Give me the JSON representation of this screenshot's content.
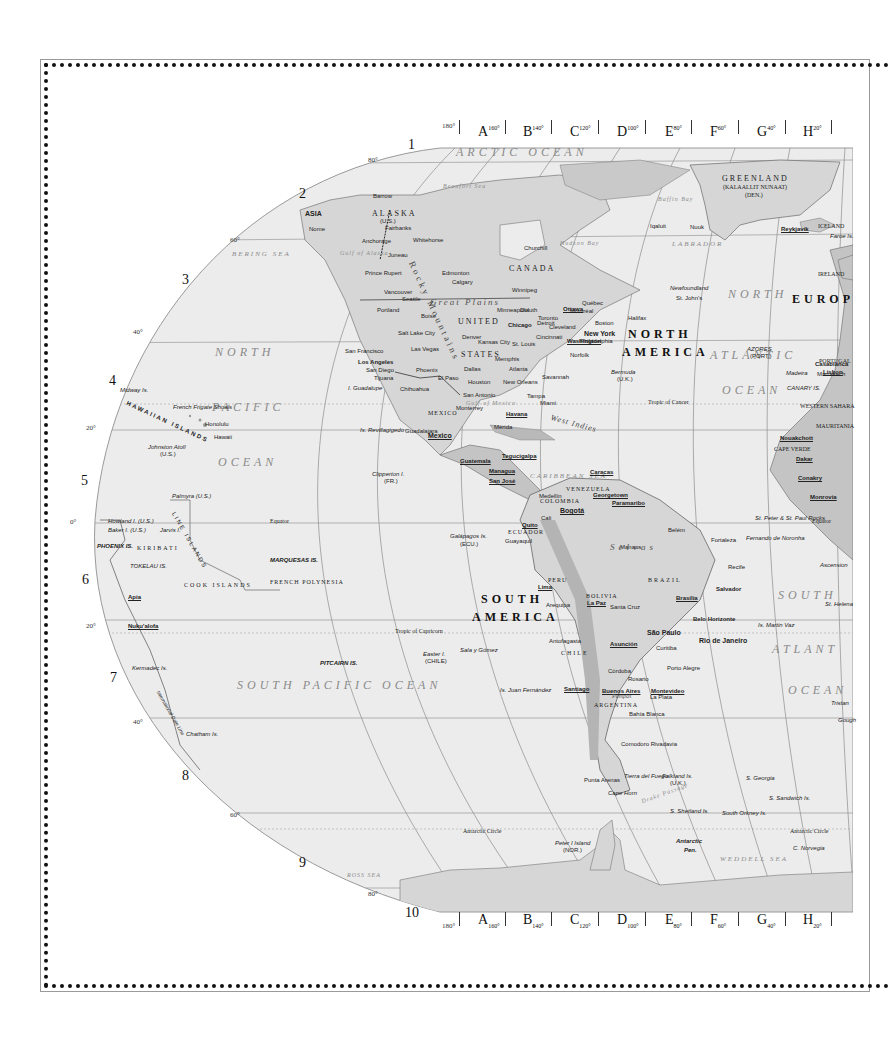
{
  "map": {
    "title": "World Map - Western Hemisphere (partial)",
    "top_columns": [
      {
        "letter": "A",
        "deg": "160°"
      },
      {
        "letter": "B",
        "deg": "140°"
      },
      {
        "letter": "C",
        "deg": "120°"
      },
      {
        "letter": "D",
        "deg": "100°"
      },
      {
        "letter": "E",
        "deg": "80°"
      },
      {
        "letter": "F",
        "deg": "60°"
      },
      {
        "letter": "G",
        "deg": "40°"
      },
      {
        "letter": "H",
        "deg": "20°"
      }
    ],
    "start_deg": "180°",
    "rows": [
      "1",
      "2",
      "3",
      "4",
      "5",
      "6",
      "7",
      "8",
      "9",
      "10"
    ],
    "lat_labels": {
      "n80": "80°",
      "n60": "60°",
      "n40": "40°",
      "n20": "20°",
      "eq": "0°",
      "s20": "20°",
      "s40": "40°",
      "s60": "60°",
      "s80": "80°"
    },
    "oceans": {
      "arctic": "ARCTIC OCEAN",
      "north_pacific_1": "NORTH",
      "north_pacific_2": "PACIFIC",
      "north_pacific_3": "OCEAN",
      "south_pacific": "SOUTH PACIFIC OCEAN",
      "north_atlantic_1": "NORTH",
      "north_atlantic_2": "ATLANTIC",
      "north_atlantic_3": "OCEAN",
      "south_atlantic_1": "SOUTH",
      "south_atlantic_2": "ATLANT",
      "south_atlantic_3": "OCEAN",
      "bering": "BERING SEA",
      "caribbean": "CARIBBEAN SEA",
      "weddell": "WEDDELL SEA",
      "ross": "ROSS SEA",
      "labrador": "LABRADOR",
      "beaufort": "Beaufort Sea",
      "hudson": "Hudson Bay",
      "baffin": "Baffin Bay",
      "gulf_mexico": "Gulf of Mexico",
      "gulf_alaska": "Gulf of Alaska",
      "drake": "Drake Passage"
    },
    "continents": {
      "north_america_1": "NORTH",
      "north_america_2": "AMERICA",
      "south_america_1": "SOUTH",
      "south_america_2": "AMERICA",
      "europe": "EUROP",
      "asia": "ASIA"
    },
    "countries": {
      "greenland": "GREENLAND",
      "greenland_sub": "(KALAALLIT NUNAAT)",
      "greenland_den": "(DEN.)",
      "canada": "CANADA",
      "alaska": "ALASKA",
      "alaska_us": "(U.S.)",
      "united": "UNITED",
      "states": "STATES",
      "mexico": "MEXICO",
      "brazil": "BRAZIL",
      "peru": "PERU",
      "bolivia": "BOLIVIA",
      "chile": "CHILE",
      "argentina": "ARGENTINA",
      "colombia": "COLOMBIA",
      "venezuela": "VENEZUELA",
      "ecuador": "ECUADOR",
      "kiribati": "KIRIBATI",
      "cook_islands": "COOK ISLANDS",
      "french_polynesia": "FRENCH POLYNESIA",
      "hawaiian_islands": "HAWAIIAN ISLANDS",
      "line_islands": "LINE ISLANDS",
      "portugal": "PORTUGAL",
      "ireland": "IRELAND",
      "mauritania": "MAURITANIA",
      "western_sahara": "WESTERN SAHARA",
      "iceland": "ICELAND"
    },
    "lines": {
      "equator_left": "Equator",
      "equator_right": "Equator",
      "tropic_cancer": "Tropic of Cancer",
      "tropic_capricorn": "Tropic of Capricorn",
      "antarctic_circle_left": "Antarctic Circle",
      "antarctic_circle_right": "Antarctic Circle",
      "idl": "International Date Line"
    },
    "capitals": {
      "mexico": "Mexico",
      "washington": "Washington",
      "ottawa": "Ottawa",
      "havana": "Havana",
      "bogota": "Bogotá",
      "caracas": "Caracas",
      "lima": "Lima",
      "la_paz": "La Paz",
      "brasilia": "Brasília",
      "santiago": "Santiago",
      "buenos_aires": "Buenos Aires",
      "montevideo": "Montevideo",
      "asuncion": "Asunción",
      "quito": "Quito",
      "reykjavik": "Reykjavík",
      "lisbon": "Lisbon",
      "dakar": "Dakar",
      "nouakchott": "Nouakchott",
      "guatemala": "Guatemala",
      "tegucigalpa": "Tegucigalpa",
      "managua": "Managua",
      "san_jose": "San José",
      "georgetown": "Georgetown",
      "paramaribo": "Paramaribo",
      "apia": "Apia",
      "nukualofa": "Nuku'alofa",
      "conakry": "Conakry",
      "monrovia": "Monrovia"
    },
    "cities": {
      "new_york": "New York",
      "los_angeles": "Los Angeles",
      "chicago": "Chicago",
      "san_francisco": "San Francisco",
      "san_diego": "San Diego",
      "tijuana": "Tijuana",
      "seattle": "Seattle",
      "vancouver": "Vancouver",
      "portland": "Portland",
      "denver": "Denver",
      "dallas": "Dallas",
      "houston": "Houston",
      "phoenix": "Phoenix",
      "el_paso": "El Paso",
      "las_vegas": "Las Vegas",
      "salt_lake": "Salt Lake City",
      "boise": "Boise",
      "miami": "Miami",
      "atlanta": "Atlanta",
      "montreal": "Montréal",
      "toronto": "Toronto",
      "boston": "Boston",
      "winnipeg": "Winnipeg",
      "edmonton": "Edmonton",
      "calgary": "Calgary",
      "anchorage": "Anchorage",
      "fairbanks": "Fairbanks",
      "honolulu": "Honolulu",
      "hawaii": "Hawaii",
      "sao_paulo": "São Paulo",
      "rio": "Rio de Janeiro",
      "salvador": "Salvador",
      "recife": "Recife",
      "fortaleza": "Fortaleza",
      "belem": "Belém",
      "manaus": "Manaus",
      "belo_horizonte": "Belo Horizonte",
      "porto_alegre": "Porto Alegre",
      "curitiba": "Curitiba",
      "cordoba": "Córdoba",
      "rosario": "Rosario",
      "la_plata": "La Plata",
      "bahia_blanca": "Bahía Blanca",
      "comodoro": "Comodoro Rivadavia",
      "punta_arenas": "Punta Arenas",
      "cape_horn": "Cape Horn",
      "guayaquil": "Guayaquil",
      "medellin": "Medellín",
      "cali": "Cali",
      "arequipa": "Arequipa",
      "antofagasta": "Antofagasta",
      "santa_cruz": "Santa Cruz",
      "casablanca": "Casablanca",
      "marrakech": "Marrakech",
      "nuuk": "Nuuk",
      "nome": "Nome",
      "barrow": "Barrow",
      "whitehorse": "Whitehorse",
      "juneau": "Juneau",
      "prince_rupert": "Prince Rupert",
      "churchill": "Churchill",
      "iqaluit": "Iqaluit",
      "halifax": "Halifax",
      "st_johns": "St. John's",
      "newfoundland": "Newfoundland",
      "chihuahua": "Chihuahua",
      "monterrey": "Monterrey",
      "merida": "Mérida",
      "guadalajara": "Guadalajara",
      "acapulco": "Acapulco",
      "san_antonio": "San Antonio",
      "new_orleans": "New Orleans",
      "memphis": "Memphis",
      "kansas_city": "Kansas City",
      "st_louis": "St. Louis",
      "cincinnati": "Cincinnati",
      "detroit": "Detroit",
      "cleveland": "Cleveland",
      "minneapolis": "Minneapolis",
      "duluth": "Duluth",
      "philadelphia": "Philadelphia",
      "norfolk": "Norfolk",
      "savannah": "Savannah",
      "tampa": "Tampa",
      "quebec": "Québec"
    },
    "islands": {
      "midway": "Midway Is.",
      "french_frigate": "French Frigate Shoals",
      "johnston": "Johnston Atoll",
      "johnston_us": "(U.S.)",
      "palmyra": "Palmyra (U.S.)",
      "howland": "Howland I. (U.S.)",
      "baker": "Baker I. (U.S.)",
      "jarvis": "Jarvis I.",
      "phoenix": "PHOENIX IS.",
      "tokelau": "TOKELAU IS.",
      "marquesas": "MARQUESAS IS.",
      "pitcairn": "PITCAIRN IS.",
      "kermadec": "Kermadec Is.",
      "chatham": "Chatham Is.",
      "galapagos": "Galápagos Is.",
      "galapagos_ecu": "(ECU.)",
      "clipperton": "Clipperton I.",
      "clipperton_fr": "(FR.)",
      "revillagigedo": "Is. Revillagigedo",
      "guadalupe": "I. Guadalupe",
      "bermuda": "Bermuda",
      "bermuda_uk": "(U.K.)",
      "azores": "AZORES",
      "azores_port": "(PORT.)",
      "madeira": "Madeira",
      "canary": "CANARY IS.",
      "cape_verde": "CAPE VERDE",
      "falkland": "Falkland Is.",
      "falkland_uk": "(U.K.)",
      "s_georgia": "S. Georgia",
      "s_sandwich": "S. Sandwich Is.",
      "s_shetland": "S. Shetland Is.",
      "s_orkney": "South Orkney Is.",
      "peter_i": "Peter I Island",
      "peter_i_nor": "(NOR.)",
      "easter": "Easter I.",
      "easter_chile": "(CHILE)",
      "sala_gomez": "Sala y Gómez",
      "juan_fernandez": "Is. Juan Fernández",
      "st_helena": "St. Helena",
      "ascension": "Ascension",
      "fernando": "Fernando de Noronha",
      "martin_vaz": "Is. Martin Vaz",
      "st_peter_paul": "St. Peter & St. Paul Rocks",
      "tristan": "Tristan",
      "gough": "Gough",
      "faroe": "Faroe Is.",
      "antarctic_pen_1": "Antarctic",
      "antarctic_pen_2": "Pen.",
      "tierra": "Tierra del Fuego",
      "c_norvegia": "C. Norvegia"
    },
    "physical": {
      "rocky": "Rocky Mountains",
      "great_plains": "Great Plains",
      "west_indies": "West Indies",
      "selvas": "Selvas",
      "pampas": "Pampas"
    },
    "colors": {
      "ocean_fill": "#ececec",
      "land_fill": "#d6d6d6",
      "land_dark": "#a9a9a9",
      "grid_line": "#8c8c8c",
      "ocean_text": "#8a8a8a",
      "border": "#111111"
    }
  }
}
